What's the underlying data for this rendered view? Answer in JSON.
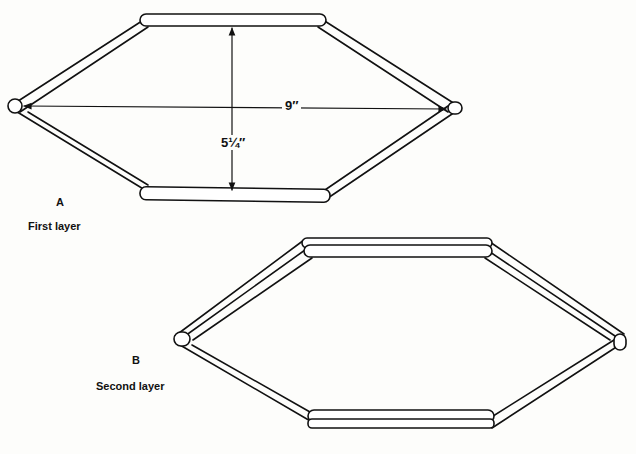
{
  "figure_a": {
    "letter": "A",
    "caption": "First layer",
    "width_label": "9″",
    "height_label": "5¼″"
  },
  "figure_b": {
    "letter": "B",
    "caption": "Second layer"
  }
}
